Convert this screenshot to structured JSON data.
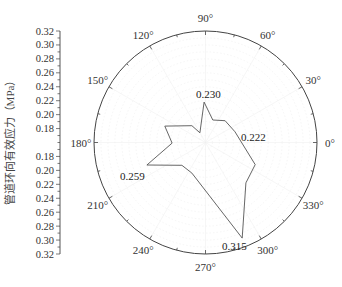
{
  "chart_data": {
    "type": "polar-line",
    "title": "",
    "ylabel": "管道环向有效应力（MPa）",
    "radial_axis": {
      "center_value": 0.16,
      "outer_value": 0.32,
      "tick_labels_top": [
        "0.32",
        "0.30",
        "0.28",
        "0.26",
        "0.24",
        "0.22",
        "0.20",
        "0.18"
      ],
      "tick_labels_bottom": [
        "0.18",
        "0.20",
        "0.22",
        "0.24",
        "0.26",
        "0.28",
        "0.30",
        "0.32"
      ]
    },
    "angular_axis": {
      "direction": "counterclockwise",
      "zero_at": "right",
      "tick_labels": [
        "0°",
        "30°",
        "60°",
        "90°",
        "120°",
        "150°",
        "180°",
        "210°",
        "240°",
        "270°",
        "300°",
        "330°"
      ]
    },
    "grid": true,
    "series": [
      {
        "name": "hoop effective stress",
        "points": [
          {
            "angle": 92,
            "value": 0.218
          },
          {
            "angle": 72,
            "value": 0.194
          },
          {
            "angle": 48,
            "value": 0.202
          },
          {
            "angle": 20,
            "value": 0.205
          },
          {
            "angle": 336,
            "value": 0.238
          },
          {
            "angle": 315,
            "value": 0.242
          },
          {
            "angle": 291,
            "value": 0.307
          },
          {
            "angle": 246,
            "value": 0.208
          },
          {
            "angle": 224,
            "value": 0.207
          },
          {
            "angle": 201,
            "value": 0.25
          },
          {
            "angle": 181,
            "value": 0.208
          },
          {
            "angle": 158,
            "value": 0.223
          },
          {
            "angle": 129,
            "value": 0.191
          },
          {
            "angle": 120,
            "value": 0.176
          }
        ]
      }
    ],
    "annotations": [
      {
        "text": "0.230",
        "x": 196,
        "y": 98
      },
      {
        "text": "0.222",
        "x": 241,
        "y": 141
      },
      {
        "text": "0.259",
        "x": 120,
        "y": 180
      },
      {
        "text": "0.315",
        "x": 222,
        "y": 250
      }
    ]
  }
}
